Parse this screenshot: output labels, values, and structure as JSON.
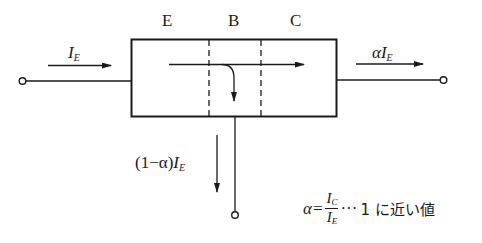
{
  "diagram": {
    "regions": [
      {
        "id": "emitter",
        "label": "E"
      },
      {
        "id": "base",
        "label": "B"
      },
      {
        "id": "collector",
        "label": "C"
      }
    ],
    "currents": {
      "emitter": {
        "symbol": "I",
        "subscript": "E"
      },
      "collector": {
        "prefix": "α",
        "symbol": "I",
        "subscript": "E"
      },
      "base": {
        "prefix": "(1−α)",
        "symbol": "I",
        "subscript": "E"
      }
    },
    "formula": {
      "lhs": "α=",
      "numerator_symbol": "I",
      "numerator_subscript": "C",
      "denominator_symbol": "I",
      "denominator_subscript": "E",
      "ellipsis": "···",
      "note": "1 に近い値"
    },
    "colors": {
      "line": "#1a1a1a",
      "background": "#ffffff"
    }
  }
}
